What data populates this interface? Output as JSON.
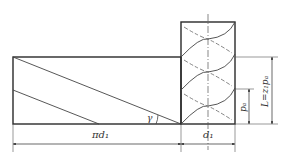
{
  "diagram": {
    "colors": {
      "line": "#2a2a2a",
      "thin": "#555555",
      "background": "#ffffff"
    },
    "labels": {
      "circumference": "πd₁",
      "diameter": "d₁",
      "lead_angle": "γ",
      "axial_pitch": "pₐ",
      "lead": "L=z₁pₐ"
    }
  }
}
